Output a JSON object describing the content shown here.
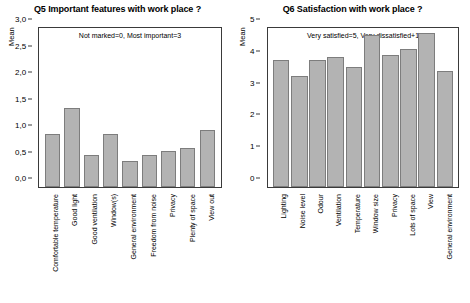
{
  "chart_data": [
    {
      "type": "bar",
      "title": "Q5 Important features with work place ?",
      "annotation": "Not marked=0, Most important=3",
      "ylabel": "Mean",
      "xlabel": "",
      "ylim": [
        0,
        3
      ],
      "yticks": [
        "0,0",
        "0,5",
        "1,0",
        "1,5",
        "2,0",
        "2,5",
        "3,0"
      ],
      "ytick_values": [
        0,
        0.5,
        1.0,
        1.5,
        2.0,
        2.5,
        3.0
      ],
      "grid": false,
      "legend": "none",
      "categories": [
        "Comfortable temperature",
        "Good light",
        "Good ventilation",
        "Window(s)",
        "General environment",
        "Freedom from noise",
        "Privacy",
        "Plenty of space",
        "View out"
      ],
      "values": [
        1.0,
        1.5,
        0.6,
        1.0,
        0.5,
        0.6,
        0.68,
        0.73,
        1.08
      ]
    },
    {
      "type": "bar",
      "title": "Q6 Satisfaction with work place ?",
      "annotation": "Very satisfied=5, Very dissatisfied+1",
      "ylabel": "Mean",
      "xlabel": "",
      "ylim": [
        0,
        5
      ],
      "yticks": [
        "0",
        "1",
        "2",
        "3",
        "4",
        "5"
      ],
      "ytick_values": [
        0,
        1,
        2,
        3,
        4,
        5
      ],
      "grid": false,
      "legend": "none",
      "categories": [
        "Lighting",
        "Noise level",
        "Odour",
        "Ventilation",
        "Temperature",
        "Window size",
        "Privacy",
        "Lots of space",
        "View",
        "General environment"
      ],
      "values": [
        4.0,
        3.48,
        3.98,
        4.08,
        3.78,
        4.78,
        4.15,
        4.35,
        4.85,
        3.65
      ]
    }
  ],
  "colors": {
    "bar_fill": "#b3b3b3",
    "bar_stroke": "#7d7d7d",
    "axis": "#3a3a3a",
    "background": "#ffffff",
    "text": "#000000"
  }
}
